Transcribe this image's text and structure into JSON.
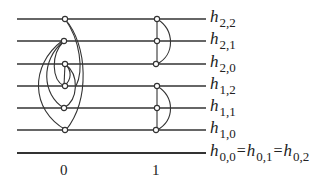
{
  "diagram": {
    "levels": [
      {
        "key": "h22",
        "symbol": "h",
        "sub": "2,2",
        "y": 19
      },
      {
        "key": "h21",
        "symbol": "h",
        "sub": "2,1",
        "y": 41
      },
      {
        "key": "h20",
        "symbol": "h",
        "sub": "2,0",
        "y": 64
      },
      {
        "key": "h12",
        "symbol": "h",
        "sub": "1,2",
        "y": 86
      },
      {
        "key": "h11",
        "symbol": "h",
        "sub": "1,1",
        "y": 108
      },
      {
        "key": "h10",
        "symbol": "h",
        "sub": "1,0",
        "y": 130
      }
    ],
    "bottom_level": {
      "y": 153,
      "terms": [
        {
          "symbol": "h",
          "sub": "0,0"
        },
        {
          "symbol": "h",
          "sub": "0,1"
        },
        {
          "symbol": "h",
          "sub": "0,2"
        }
      ],
      "equals": "="
    },
    "x_labels": [
      "0",
      "1"
    ],
    "colors": {
      "line": "#333333",
      "node_fill": "#ffffff"
    }
  }
}
